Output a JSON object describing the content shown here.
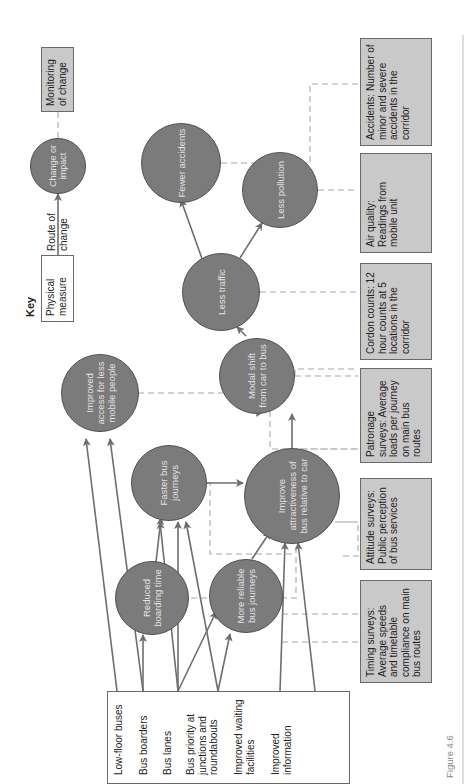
{
  "figure_label": "Figure 4.6",
  "key": {
    "title": "Key",
    "physical_measure": "Physical measure",
    "route_of_change": "Route of change",
    "change_or_impact": "Change or impact",
    "monitoring_of_change": "Monitoring of change"
  },
  "measures": [
    "Low-floor buses",
    "Bus boarders",
    "Bus lanes",
    "Bus priority at junctions and roundabouts",
    "Improved waiting facilities",
    "Improved information"
  ],
  "impacts": {
    "reduced_boarding": "Reduced boarding time",
    "more_reliable": "More reliable bus journeys",
    "faster_journeys": "Faster bus journeys",
    "improve_attractiveness": "Improve attractiveness of bus relative to car",
    "improved_access": "Improved access for less mobile people",
    "modal_shift": "Modal shift from car to bus",
    "less_traffic": "Less traffic",
    "less_pollution": "Less pollution",
    "fewer_accidents": "Fewer accidents"
  },
  "monitoring": {
    "timing": "Timing surveys: Average speeds and timetable compliance on main bus routes",
    "attitude": "Attitude surveys: Public perception of bus services",
    "patronage": "Patronage surveys: Average loads per journey on main bus routes",
    "cordon": "Cordon counts: 12 hour counts at 5 locations in the corridor",
    "air_quality": "Air quality: Readings from mobile unit",
    "accidents": "Accidents: Number of minor and severe accidents in the corridor"
  },
  "colors": {
    "circle_fill": "#7b7b7b",
    "circle_text": "#e2e2e2",
    "monitor_box_fill": "#c9c9c9",
    "arrow": "#6e6e6e",
    "dashed_link": "#c4c4c4"
  }
}
